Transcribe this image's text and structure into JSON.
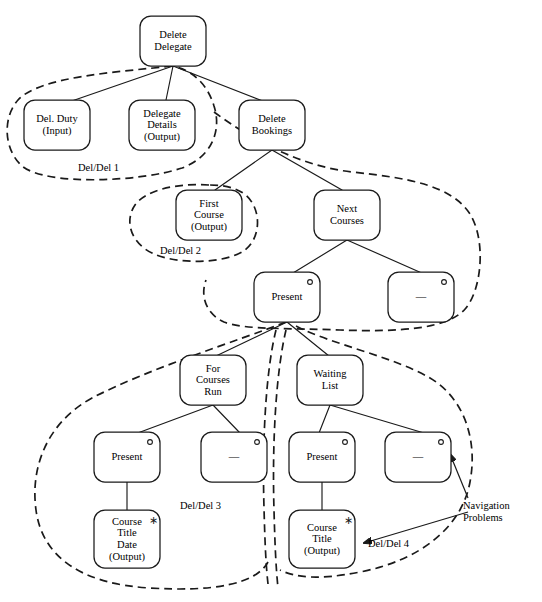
{
  "diagram": {
    "stroke_color": "#1a1a1a",
    "dashed_color": "#1a1a1a",
    "background": "#ffffff",
    "nodes": [
      {
        "id": "delete-delegate",
        "label": "Delete\nDelegate",
        "x": 140,
        "y": 16,
        "w": 66,
        "h": 50,
        "marker": "none"
      },
      {
        "id": "del-duty",
        "label": "Del. Duty\n(Input)",
        "x": 24,
        "y": 100,
        "w": 66,
        "h": 50,
        "marker": "none"
      },
      {
        "id": "delegate-details",
        "label": "Delegate\nDetails\n(Output)",
        "x": 129,
        "y": 100,
        "w": 66,
        "h": 50,
        "marker": "none"
      },
      {
        "id": "delete-bookings",
        "label": "Delete\nBookings",
        "x": 239,
        "y": 100,
        "w": 66,
        "h": 50,
        "marker": "none"
      },
      {
        "id": "first-course",
        "label": "First\nCourse\n(Output)",
        "x": 176,
        "y": 190,
        "w": 66,
        "h": 50,
        "marker": "none"
      },
      {
        "id": "next-courses",
        "label": "Next\nCourses",
        "x": 314,
        "y": 190,
        "w": 66,
        "h": 50,
        "marker": "none"
      },
      {
        "id": "present-1",
        "label": "Present",
        "x": 254,
        "y": 272,
        "w": 66,
        "h": 50,
        "marker": "circle"
      },
      {
        "id": "dash-1",
        "label": "—",
        "x": 388,
        "y": 272,
        "w": 66,
        "h": 50,
        "marker": "circle"
      },
      {
        "id": "for-courses-run",
        "label": "For\nCourses\nRun",
        "x": 180,
        "y": 355,
        "w": 66,
        "h": 50,
        "marker": "none"
      },
      {
        "id": "waiting-list",
        "label": "Waiting\nList",
        "x": 297,
        "y": 355,
        "w": 66,
        "h": 50,
        "marker": "none"
      },
      {
        "id": "present-2",
        "label": "Present",
        "x": 94,
        "y": 432,
        "w": 66,
        "h": 50,
        "marker": "circle"
      },
      {
        "id": "dash-2",
        "label": "—",
        "x": 201,
        "y": 432,
        "w": 66,
        "h": 50,
        "marker": "circle"
      },
      {
        "id": "present-3",
        "label": "Present",
        "x": 289,
        "y": 432,
        "w": 66,
        "h": 50,
        "marker": "circle"
      },
      {
        "id": "dash-3",
        "label": "—",
        "x": 385,
        "y": 432,
        "w": 66,
        "h": 50,
        "marker": "circle"
      },
      {
        "id": "course-title-date",
        "label": "Course\nTitle\nDate\n(Output)",
        "x": 94,
        "y": 510,
        "w": 66,
        "h": 58,
        "marker": "asterisk"
      },
      {
        "id": "course-title",
        "label": "Course\nTitle\n(Output)",
        "x": 289,
        "y": 510,
        "w": 66,
        "h": 58,
        "marker": "asterisk"
      }
    ],
    "group_labels": [
      {
        "id": "group-del-del-1",
        "text": "Del/Del 1",
        "x": 78,
        "y": 162
      },
      {
        "id": "group-del-del-2",
        "text": "Del/Del 2",
        "x": 160,
        "y": 245
      },
      {
        "id": "group-del-del-3",
        "text": "Del/Del 3",
        "x": 180,
        "y": 500
      },
      {
        "id": "group-del-del-4",
        "text": "Del/Del 4",
        "x": 368,
        "y": 538
      }
    ],
    "annotations": [
      {
        "id": "navigation-problems",
        "text": "Navigation\nProblems",
        "x": 463,
        "y": 500
      }
    ],
    "edges": [
      {
        "from": "delete-delegate",
        "to": "del-duty"
      },
      {
        "from": "delete-delegate",
        "to": "delegate-details"
      },
      {
        "from": "delete-delegate",
        "to": "delete-bookings"
      },
      {
        "from": "delete-bookings",
        "to": "first-course"
      },
      {
        "from": "delete-bookings",
        "to": "next-courses"
      },
      {
        "from": "next-courses",
        "to": "present-1"
      },
      {
        "from": "next-courses",
        "to": "dash-1"
      },
      {
        "from": "present-1",
        "to": "for-courses-run"
      },
      {
        "from": "present-1",
        "to": "waiting-list"
      },
      {
        "from": "for-courses-run",
        "to": "present-2"
      },
      {
        "from": "for-courses-run",
        "to": "dash-2"
      },
      {
        "from": "waiting-list",
        "to": "present-3"
      },
      {
        "from": "waiting-list",
        "to": "dash-3"
      },
      {
        "from": "present-2",
        "to": "course-title-date"
      },
      {
        "from": "present-3",
        "to": "course-title"
      }
    ]
  }
}
